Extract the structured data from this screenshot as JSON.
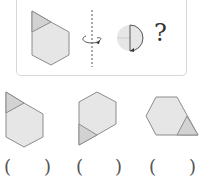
{
  "question": {
    "given_shape": "hexagon-with-triangle-top-left",
    "rotation_symbol": "rotate-around-vertical-axis",
    "result_shape": "half-circle-right",
    "question_mark": "?"
  },
  "options": [
    {
      "shape": "hexagon-with-triangle-top-left",
      "open_paren": "(",
      "close_paren": ")"
    },
    {
      "shape": "hexagon-with-triangle-bottom-left",
      "open_paren": "(",
      "close_paren": ")"
    },
    {
      "shape": "hexagon-with-triangle-bottom-right",
      "open_paren": "(",
      "close_paren": ")"
    }
  ],
  "colors": {
    "fill": "#e6e6e6",
    "triangle_fill": "#d2d2d2",
    "stroke": "#8c8c8c",
    "border": "#d8d8d8"
  }
}
